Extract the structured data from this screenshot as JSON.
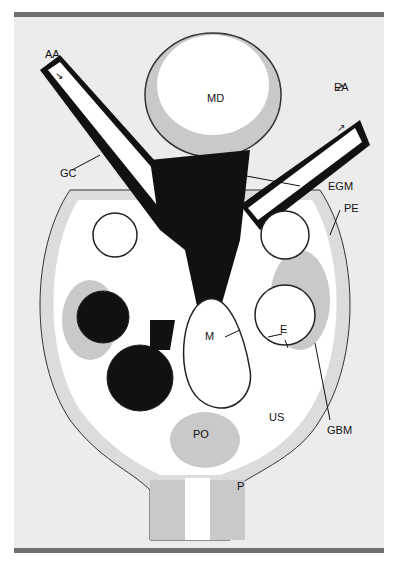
{
  "figure": {
    "colors": {
      "background": "#ececec",
      "frame_bar": "#6f6f6f",
      "mesangium": "#111111",
      "epithelium": "#c9c9c9",
      "lumen": "#ffffff",
      "outline": "#222222"
    },
    "labels": {
      "aa": "AA",
      "ea": "EA",
      "md": "MD",
      "gc": "GC",
      "egm": "EGM",
      "pe": "PE",
      "m": "M",
      "e": "E",
      "gbm": "GBM",
      "us": "US",
      "po": "PO",
      "p": "P"
    },
    "arrows": {
      "aa_flow": "↘",
      "ea_flow": "↗"
    }
  }
}
